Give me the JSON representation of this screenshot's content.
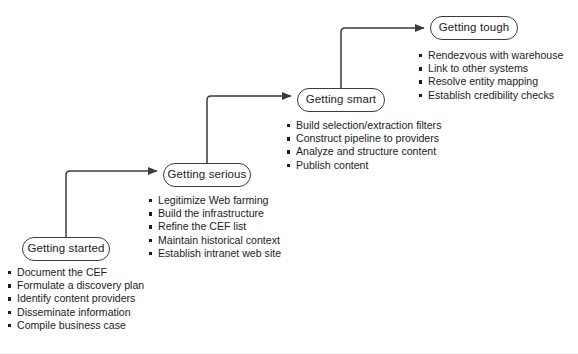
{
  "diagram": {
    "type": "staged-flow",
    "orientation": "ascending-left-to-right",
    "colors": {
      "stroke": "#3b3b3b",
      "text": "#1c1c1c",
      "background": "#ffffff",
      "connector": "#3b3b3b"
    },
    "stages": [
      {
        "id": "getting-started",
        "label": "Getting started",
        "order": 1,
        "box": {
          "x": 22,
          "y": 237,
          "width": 88,
          "height": 24
        },
        "tasks_origin": {
          "x": 8,
          "y": 266
        },
        "tasks": [
          "Document the CEF",
          "Formulate a discovery plan",
          "Identify content providers",
          "Disseminate information",
          "Compile business case"
        ]
      },
      {
        "id": "getting-serious",
        "label": "Getting serious",
        "order": 2,
        "box": {
          "x": 163,
          "y": 163,
          "width": 88,
          "height": 24
        },
        "tasks_origin": {
          "x": 149,
          "y": 194
        },
        "tasks": [
          "Legitimize Web farming",
          "Build the infrastructure",
          "Refine the CEF list",
          "Maintain historical context",
          "Establish intranet web site"
        ]
      },
      {
        "id": "getting-smart",
        "label": "Getting smart",
        "order": 3,
        "box": {
          "x": 297,
          "y": 88,
          "width": 88,
          "height": 24
        },
        "tasks_origin": {
          "x": 287,
          "y": 119
        },
        "tasks": [
          "Build selection/extraction filters",
          "Construct pipeline to providers",
          "Analyze and structure content",
          "Publish content"
        ]
      },
      {
        "id": "getting-tough",
        "label": "Getting tough",
        "order": 4,
        "box": {
          "x": 430,
          "y": 16,
          "width": 88,
          "height": 24
        },
        "tasks_origin": {
          "x": 419,
          "y": 49
        },
        "tasks": [
          "Rendezvous with warehouse",
          "Link to other systems",
          "Resolve entity mapping",
          "Establish credibility checks"
        ]
      }
    ],
    "connectors": [
      {
        "id": "connector-started-to-serious",
        "from": "getting-started",
        "to": "getting-serious",
        "path": "M 66 237 L 66 175 Q 66 171 70 171 L 157 171"
      },
      {
        "id": "connector-serious-to-smart",
        "from": "getting-serious",
        "to": "getting-smart",
        "path": "M 207 163 L 207 100 Q 207 96 211 96 L 291 96"
      },
      {
        "id": "connector-smart-to-tough",
        "from": "getting-smart",
        "to": "getting-tough",
        "path": "M 341 88 L 341 32 Q 341 28 345 28 L 424 28"
      }
    ]
  }
}
